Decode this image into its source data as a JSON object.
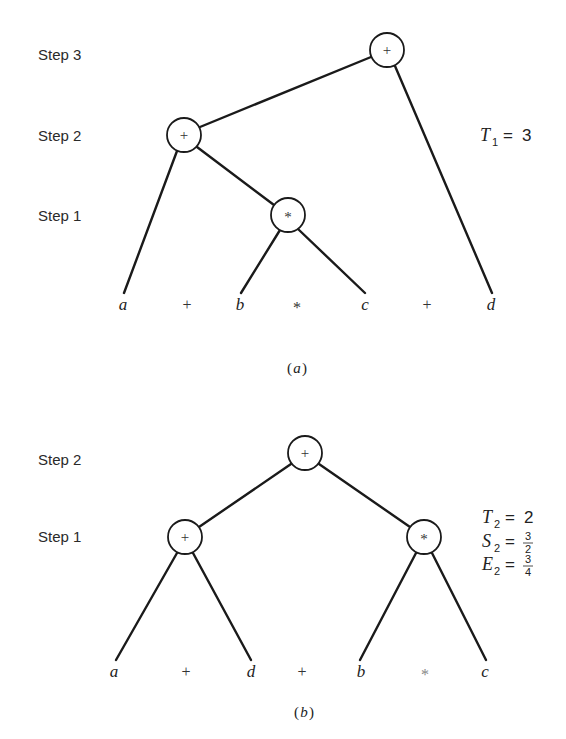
{
  "diagram_a": {
    "caption_open": "(",
    "caption_letter": "a",
    "caption_close": ")",
    "steps": [
      "Step 3",
      "Step 2",
      "Step 1"
    ],
    "nodes": [
      {
        "id": "a-root",
        "op": "+",
        "step": 3
      },
      {
        "id": "a-step2",
        "op": "+",
        "step": 2
      },
      {
        "id": "a-step1",
        "op": "*",
        "step": 1
      }
    ],
    "leaves": [
      "a",
      "+",
      "b",
      "*",
      "c",
      "+",
      "d"
    ],
    "metric": {
      "var": "T",
      "sub": "1",
      "eq": "=",
      "value": "3"
    }
  },
  "diagram_b": {
    "caption_open": "(",
    "caption_letter": "b",
    "caption_close": ")",
    "steps": [
      "Step 2",
      "Step 1"
    ],
    "nodes": [
      {
        "id": "b-root",
        "op": "+",
        "step": 2
      },
      {
        "id": "b-left",
        "op": "+",
        "step": 1
      },
      {
        "id": "b-right",
        "op": "*",
        "step": 1
      }
    ],
    "leaves": [
      "a",
      "+",
      "d",
      "+",
      "b",
      "*",
      "c"
    ],
    "metrics": [
      {
        "var": "T",
        "sub": "2",
        "eq": "=",
        "value": "2"
      },
      {
        "var": "S",
        "sub": "2",
        "eq": "=",
        "num": "3",
        "den": "2"
      },
      {
        "var": "E",
        "sub": "2",
        "eq": "=",
        "num": "3",
        "den": "4"
      }
    ]
  }
}
